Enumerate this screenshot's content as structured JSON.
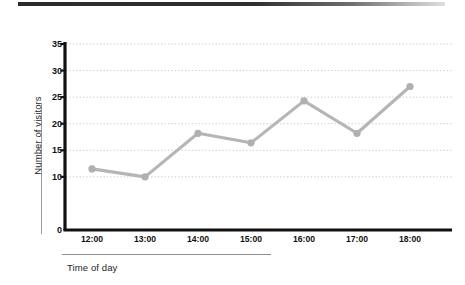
{
  "figure": {
    "header_rule": "top-dark-rule"
  },
  "chart_data": {
    "type": "line",
    "title": "",
    "xlabel": "Time of day",
    "ylabel": "Number of visitors",
    "categories": [
      "12:00",
      "13:00",
      "14:00",
      "15:00",
      "16:00",
      "17:00",
      "18:00"
    ],
    "values": [
      11.5,
      10,
      18.2,
      16.4,
      24.3,
      18.2,
      27
    ],
    "series": [
      {
        "name": "Number of visitors",
        "values": [
          11.5,
          10,
          18.2,
          16.4,
          24.3,
          18.2,
          27
        ]
      }
    ],
    "ylim": [
      0,
      35
    ],
    "ytick_labels": [
      "0",
      "10",
      "15",
      "20",
      "25",
      "30",
      "35"
    ],
    "ytick_values": [
      0,
      10,
      15,
      20,
      25,
      30,
      35
    ],
    "gridline_values": [
      10,
      15,
      20,
      25,
      30,
      35
    ],
    "grid": true,
    "grid_style": "dotted",
    "legend": "none",
    "marker": "circle",
    "colors": {
      "line": "#b5b5b5",
      "marker": "#b0b0b0",
      "axis": "#111111",
      "grid": "#c9c9c9",
      "text": "#101010",
      "header_rule": "#2b2b2b"
    }
  }
}
